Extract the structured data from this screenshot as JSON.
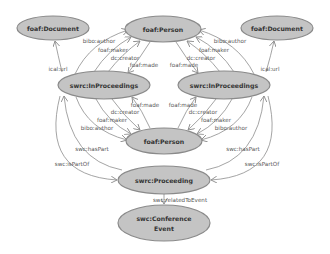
{
  "diagram": {
    "type": "rdf-ontology-graph",
    "colors": {
      "node_fill": "#c4c4c4",
      "node_stroke": "#8a8a8a",
      "edge": "#8d8d8d",
      "label_text": "#333333",
      "edge_text": "#555555",
      "background": "#ffffff"
    },
    "nodes": [
      {
        "id": "doc_left",
        "label": "foaf:Document",
        "cx": 53,
        "cy": 28,
        "rx": 36,
        "ry": 12
      },
      {
        "id": "person_top",
        "label": "foaf:Person",
        "cx": 163,
        "cy": 29,
        "rx": 38,
        "ry": 13
      },
      {
        "id": "doc_right",
        "label": "foaf:Document",
        "cx": 277,
        "cy": 28,
        "rx": 36,
        "ry": 12
      },
      {
        "id": "inproc_left",
        "label": "swrc:InProceedings",
        "cx": 104,
        "cy": 85,
        "rx": 46,
        "ry": 14
      },
      {
        "id": "inproc_right",
        "label": "swrc:InProceedings",
        "cx": 224,
        "cy": 85,
        "rx": 46,
        "ry": 14
      },
      {
        "id": "person_bottom",
        "label": "foaf:Person",
        "cx": 164,
        "cy": 141,
        "rx": 38,
        "ry": 13
      },
      {
        "id": "proceeding",
        "label": "swrc:Proceeding",
        "cx": 164,
        "cy": 180,
        "rx": 46,
        "ry": 14
      },
      {
        "id": "conf_event",
        "label_line1": "swc:Conference",
        "label_line2": "Event",
        "cx": 164,
        "cy": 223,
        "rx": 46,
        "ry": 18
      }
    ],
    "edges": [
      {
        "from": "inproc_left",
        "to": "doc_left",
        "label": "ical:url"
      },
      {
        "from": "inproc_right",
        "to": "doc_right",
        "label": "ical:url"
      },
      {
        "from": "inproc_left",
        "to": "person_top",
        "label": "bibo:author"
      },
      {
        "from": "inproc_left",
        "to": "person_top",
        "label": "foaf:maker"
      },
      {
        "from": "inproc_left",
        "to": "person_top",
        "label": "dc:creator"
      },
      {
        "from": "person_top",
        "to": "inproc_left",
        "label": "foaf:made"
      },
      {
        "from": "inproc_right",
        "to": "person_top",
        "label": "bibo:author"
      },
      {
        "from": "inproc_right",
        "to": "person_top",
        "label": "foaf:maker"
      },
      {
        "from": "inproc_right",
        "to": "person_top",
        "label": "dc:creator"
      },
      {
        "from": "person_top",
        "to": "inproc_right",
        "label": "foaf:made"
      },
      {
        "from": "person_bottom",
        "to": "inproc_left",
        "label": "foaf:made"
      },
      {
        "from": "inproc_left",
        "to": "person_bottom",
        "label": "dc:creator"
      },
      {
        "from": "inproc_left",
        "to": "person_bottom",
        "label": "foaf:maker"
      },
      {
        "from": "inproc_left",
        "to": "person_bottom",
        "label": "bibo:author"
      },
      {
        "from": "person_bottom",
        "to": "inproc_right",
        "label": "foaf:made"
      },
      {
        "from": "inproc_right",
        "to": "person_bottom",
        "label": "dc:creator"
      },
      {
        "from": "inproc_right",
        "to": "person_bottom",
        "label": "foaf:maker"
      },
      {
        "from": "inproc_right",
        "to": "person_bottom",
        "label": "bibo:author"
      },
      {
        "from": "proceeding",
        "to": "inproc_left",
        "label": "swc:hasPart"
      },
      {
        "from": "inproc_left",
        "to": "proceeding",
        "label": "swc:isPartOf"
      },
      {
        "from": "proceeding",
        "to": "inproc_right",
        "label": "swc:hasPart"
      },
      {
        "from": "inproc_right",
        "to": "proceeding",
        "label": "swc:isPartOf"
      },
      {
        "from": "proceeding",
        "to": "conf_event",
        "label": "swc:relatedToEvent"
      }
    ]
  }
}
